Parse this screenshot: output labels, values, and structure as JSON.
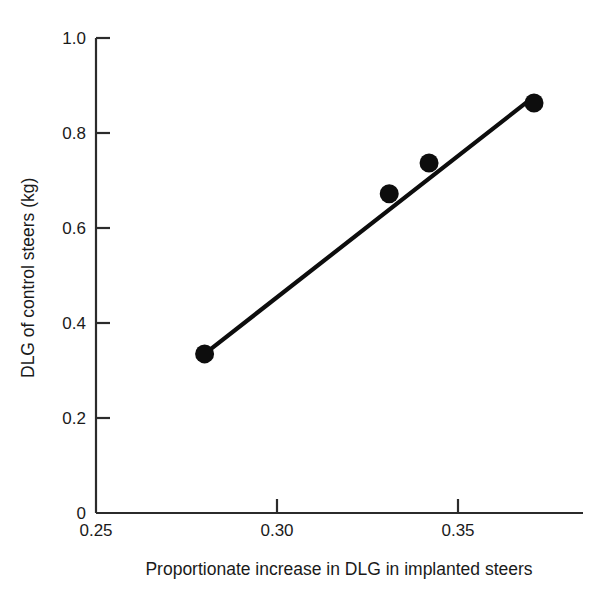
{
  "chart_data": {
    "type": "scatter",
    "title": "",
    "xlabel": "Proportionate increase in DLG in implanted steers",
    "ylabel": "DLG of control steers (kg)",
    "xlim": [
      0.25,
      0.3715
    ],
    "ylim": [
      0,
      1.0
    ],
    "grid": false,
    "legend": null,
    "x_ticks": [
      {
        "value": 0.25,
        "label": "0.25"
      },
      {
        "value": 0.3,
        "label": "0.30"
      },
      {
        "value": 0.35,
        "label": "0.35"
      }
    ],
    "y_ticks": [
      {
        "value": 0,
        "label": "0"
      },
      {
        "value": 0.2,
        "label": "0.2"
      },
      {
        "value": 0.4,
        "label": "0.4"
      },
      {
        "value": 0.6,
        "label": "0.6"
      },
      {
        "value": 0.8,
        "label": "0.8"
      },
      {
        "value": 1.0,
        "label": "1.0"
      }
    ],
    "series": [
      {
        "name": "observations",
        "marker": "filled-circle",
        "color": "#0d0d0d",
        "points": [
          {
            "x": 0.28,
            "y": 0.335
          },
          {
            "x": 0.331,
            "y": 0.672
          },
          {
            "x": 0.342,
            "y": 0.737
          },
          {
            "x": 0.371,
            "y": 0.863
          }
        ]
      },
      {
        "name": "regression-line",
        "marker": "line",
        "color": "#0d0d0d",
        "points": [
          {
            "x": 0.28,
            "y": 0.335
          },
          {
            "x": 0.3707,
            "y": 0.875
          }
        ]
      }
    ]
  },
  "axes": {
    "y_axis_title": "DLG of control steers (kg)",
    "x_axis_title": "Proportionate increase in DLG in implanted steers"
  }
}
